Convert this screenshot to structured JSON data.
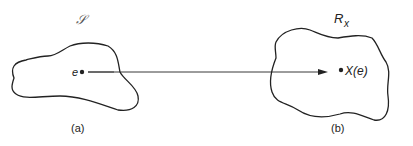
{
  "diagram": {
    "type": "mapping",
    "sample_space": {
      "label": "𝒮",
      "point_label": "e",
      "caption": "(a)"
    },
    "range_space": {
      "label_main": "R",
      "label_sub": "x",
      "point_label": "X(e)",
      "caption": "(b)"
    },
    "arrow": {
      "from": "e",
      "to": "X(e)"
    },
    "colors": {
      "stroke": "#222222",
      "background": "#ffffff"
    }
  }
}
